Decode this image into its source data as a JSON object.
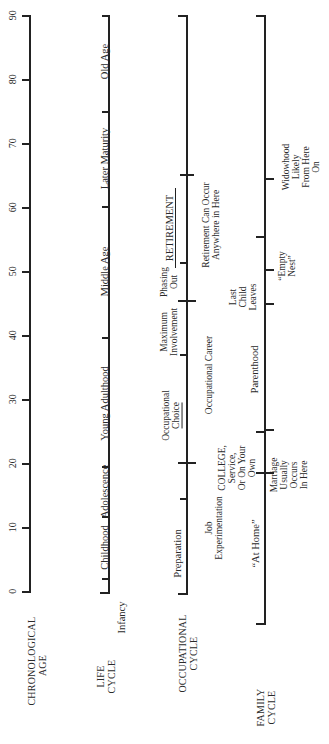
{
  "diagram": {
    "type": "life-stage timeline (rotated 90° counter-clockwise)",
    "axis": {
      "label": [
        "CHRONOLOGICAL",
        "AGE"
      ],
      "ticks": [
        0,
        10,
        20,
        30,
        40,
        50,
        60,
        70,
        80,
        90
      ],
      "tick_labels": [
        "0",
        "10",
        "20",
        "30",
        "40",
        "50",
        "60",
        "70",
        "80",
        "90"
      ]
    },
    "life_cycle": {
      "label": [
        "LIFE",
        "CYCLE"
      ],
      "stages": [
        {
          "label": "Infancy",
          "from": 0,
          "to": 2
        },
        {
          "label": "Childhood",
          "from": 2,
          "to": 12
        },
        {
          "label": "Adolescence",
          "from": 12,
          "to": 20
        },
        {
          "label": "Young Adulthood",
          "from": 20,
          "to": 40
        },
        {
          "label": "Middle Age",
          "from": 40,
          "to": 60
        },
        {
          "label": "Later Maturity",
          "from": 60,
          "to": 75
        },
        {
          "label": "Old Age",
          "from": 75,
          "to": 90
        }
      ]
    },
    "occupational_cycle": {
      "label": [
        "OCCUPATIONAL",
        "CYCLE"
      ],
      "stages": [
        {
          "label": "Preparation",
          "from": 0,
          "to": 15
        },
        {
          "label": [
            "Job",
            "Experimentation"
          ],
          "from": 15,
          "to": 20
        },
        {
          "label": [
            "Occupational",
            "Choice"
          ],
          "from": 20,
          "to": 27
        },
        {
          "label": [
            "Maximum",
            "Involvement"
          ],
          "from": 35,
          "to": 45
        },
        {
          "label": [
            "Phasing",
            "Out"
          ],
          "from": 45,
          "to": 52
        },
        {
          "label": "RETIREMENT",
          "from": 52,
          "to": 65
        },
        {
          "label": [
            "Retirement Can Occur",
            "Anywhere in Here"
          ],
          "from": 50,
          "to": 70
        }
      ],
      "career_label": "Occupational Career",
      "career_from": 20,
      "career_to": 45
    },
    "family_cycle": {
      "label": [
        "FAMILY",
        "CYCLE"
      ],
      "stages": [
        {
          "label": "“At Home”",
          "from": 0,
          "to": 18
        },
        {
          "label": [
            "COLLEGE,",
            "Service,",
            "Or On Your",
            "Own"
          ],
          "from": 18,
          "to": 23
        },
        {
          "label": [
            "Marriage",
            "Usually",
            "Occurs",
            "In Here"
          ],
          "from": 18,
          "to": 25
        },
        {
          "label": "Parenthood",
          "from": 25,
          "to": 45
        },
        {
          "label": [
            "Last",
            "Child",
            "Leaves"
          ],
          "from": 45,
          "to": 51
        },
        {
          "label": [
            "“Empty",
            "Nest”"
          ],
          "from": 51,
          "to": 57
        },
        {
          "label": [
            "Widowhood",
            "Likely",
            "From Here",
            "On"
          ],
          "from": 64,
          "to": 90
        }
      ]
    }
  }
}
